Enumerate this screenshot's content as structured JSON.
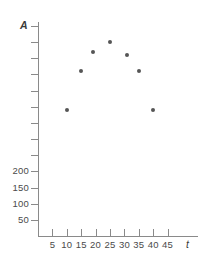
{
  "chart_data": {
    "type": "scatter",
    "title": "",
    "xlabel": "t",
    "ylabel": "A",
    "x": [
      10,
      15,
      19,
      25,
      31,
      35,
      40
    ],
    "values": [
      390,
      510,
      570,
      600,
      560,
      510,
      390
    ],
    "points": [
      {
        "x": 10,
        "y": 390
      },
      {
        "x": 15,
        "y": 510
      },
      {
        "x": 19,
        "y": 570
      },
      {
        "x": 25,
        "y": 600
      },
      {
        "x": 31,
        "y": 560
      },
      {
        "x": 35,
        "y": 510
      },
      {
        "x": 40,
        "y": 390
      }
    ],
    "xlim": [
      0,
      50
    ],
    "ylim": [
      0,
      650
    ],
    "xticks": [
      5,
      10,
      15,
      20,
      25,
      30,
      35,
      40,
      45
    ],
    "xtick_labels": [
      "5",
      "10",
      "15",
      "20",
      "25",
      "30",
      "35",
      "40",
      "45"
    ],
    "yticks": [
      50,
      100,
      150,
      200,
      250,
      300,
      350,
      400,
      450,
      500,
      550,
      600,
      650
    ],
    "ytick_labels": [
      "50",
      "100",
      "150",
      "200",
      "",
      "",
      "",
      "",
      "",
      "",
      "",
      "",
      ""
    ],
    "grid": false,
    "legend": null,
    "marker_color": "#555555",
    "axis_color": "#8a8a8a"
  }
}
